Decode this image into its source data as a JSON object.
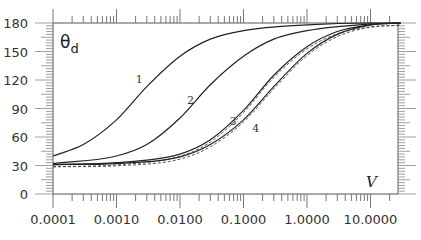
{
  "chart_data": {
    "type": "line",
    "title": "",
    "xlabel": "V",
    "ylabel": "θd",
    "xscale": "log",
    "xlim": [
      0.0001,
      30
    ],
    "ylim": [
      0,
      180
    ],
    "x_tick_labels": [
      "0.0001",
      "0.0010",
      "0.0100",
      "0.1000",
      "1.0000",
      "10.0000"
    ],
    "x_ticks": [
      0.0001,
      0.001,
      0.01,
      0.1,
      1,
      10
    ],
    "y_tick_labels": [
      "0",
      "30",
      "60",
      "90",
      "120",
      "150",
      "180"
    ],
    "y_ticks": [
      0,
      30,
      60,
      90,
      120,
      150,
      180
    ],
    "grid": false,
    "legend": "none; curves labeled inline 1-4",
    "series": [
      {
        "name": "1",
        "style": "solid",
        "x": [
          0.0001,
          0.0003,
          0.001,
          0.003,
          0.01,
          0.03,
          0.1,
          1,
          10,
          30
        ],
        "y": [
          40,
          52,
          78,
          113,
          145,
          163,
          172,
          178,
          180,
          180
        ],
        "label_pos": {
          "x": 0.0025,
          "y": 117
        }
      },
      {
        "name": "2",
        "style": "solid",
        "x": [
          0.0001,
          0.001,
          0.003,
          0.01,
          0.03,
          0.1,
          0.3,
          1,
          10,
          30
        ],
        "y": [
          32,
          40,
          52,
          80,
          115,
          145,
          163,
          172,
          179,
          180
        ],
        "label_pos": {
          "x": 0.016,
          "y": 95
        }
      },
      {
        "name": "3",
        "style": "solid with dashed companion",
        "x": [
          0.0001,
          0.001,
          0.01,
          0.03,
          0.1,
          0.3,
          1,
          3,
          10,
          30
        ],
        "y": [
          31,
          33,
          42,
          57,
          88,
          125,
          155,
          171,
          178,
          180
        ],
        "label_pos": {
          "x": 0.075,
          "y": 73
        }
      },
      {
        "name": "4",
        "style": "solid with dashed companion",
        "x": [
          0.0001,
          0.001,
          0.01,
          0.03,
          0.1,
          0.3,
          1,
          3,
          10,
          30
        ],
        "y": [
          31,
          32,
          39,
          52,
          78,
          113,
          148,
          168,
          178,
          180
        ],
        "label_pos": {
          "x": 0.17,
          "y": 65
        }
      }
    ]
  }
}
